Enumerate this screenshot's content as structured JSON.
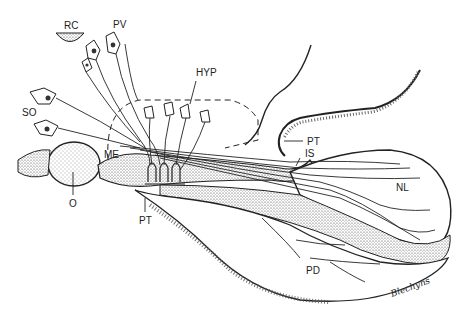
{
  "figure": {
    "type": "anatomical illustration",
    "labels": {
      "rc": "RC",
      "pv": "PV",
      "hyp": "HYP",
      "so": "SO",
      "me": "ME",
      "o": "O",
      "pt_lower": "PT",
      "pt_upper": "PT",
      "is": "IS",
      "nl": "NL",
      "pd": "PD"
    },
    "signature": "Blechyns"
  }
}
